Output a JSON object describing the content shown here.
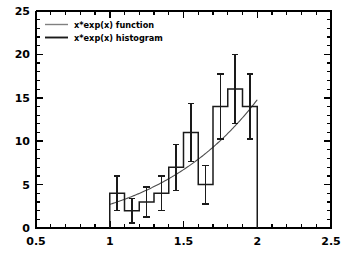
{
  "chart_data": {
    "type": "bar",
    "title": "",
    "xlabel": "",
    "ylabel": "",
    "xlim": [
      0.5,
      2.5
    ],
    "ylim": [
      0,
      25
    ],
    "grid": false,
    "legend_position": "top-left",
    "x_ticks": [
      "0.5",
      "1",
      "1.5",
      "2",
      "2.5"
    ],
    "x_tick_values": [
      0.5,
      1.0,
      1.5,
      2.0,
      2.5
    ],
    "x_minor_tick_values": [
      0.6,
      0.7,
      0.8,
      0.9,
      1.1,
      1.2,
      1.3,
      1.4,
      1.6,
      1.7,
      1.8,
      1.9,
      2.1,
      2.2,
      2.3,
      2.4
    ],
    "y_ticks": [
      "0",
      "5",
      "10",
      "15",
      "20",
      "25"
    ],
    "y_tick_values": [
      0,
      5,
      10,
      15,
      20,
      25
    ],
    "y_minor_tick_values": [
      1,
      2,
      3,
      4,
      6,
      7,
      8,
      9,
      11,
      12,
      13,
      14,
      16,
      17,
      18,
      19,
      21,
      22,
      23,
      24
    ],
    "bin_edges": [
      1.0,
      1.1,
      1.2,
      1.3,
      1.4,
      1.5,
      1.6,
      1.7,
      1.8,
      1.9,
      2.0
    ],
    "bin_centers": [
      1.05,
      1.15,
      1.25,
      1.35,
      1.45,
      1.55,
      1.65,
      1.75,
      1.85,
      1.95
    ],
    "values": [
      4,
      2,
      3,
      4,
      7,
      11,
      5,
      14,
      16,
      14
    ],
    "errors": [
      2.0,
      1.41,
      1.73,
      2.0,
      2.65,
      3.32,
      2.24,
      3.74,
      4.0,
      3.74
    ],
    "series": [
      {
        "name": "x*exp(x) histogram",
        "type": "step-histogram",
        "color": "#1a1a1a",
        "values": [
          4,
          2,
          3,
          4,
          7,
          11,
          5,
          14,
          16,
          14
        ]
      },
      {
        "name": "x*exp(x) function",
        "type": "line",
        "color": "#4d4d4d",
        "formula": "x*exp(x)",
        "x_range": [
          1.0,
          2.0
        ],
        "x": [
          1.0,
          1.1,
          1.2,
          1.3,
          1.4,
          1.5,
          1.6,
          1.7,
          1.8,
          1.9,
          2.0
        ],
        "y": [
          2.72,
          3.3,
          3.98,
          4.77,
          5.68,
          6.72,
          7.92,
          9.3,
          10.89,
          12.71,
          14.78
        ]
      }
    ]
  },
  "legend": {
    "entries": [
      {
        "label": "x*exp(x) function",
        "swatch": "line-light"
      },
      {
        "label": "x*exp(x) histogram",
        "swatch": "line-dark"
      }
    ]
  },
  "axes": {
    "x_labels": [
      "0.5",
      "1",
      "1.5",
      "2",
      "2.5"
    ],
    "y_labels": [
      "0",
      "5",
      "10",
      "15",
      "20",
      "25"
    ]
  },
  "colors": {
    "background": "#ffffff",
    "axis": "#000000",
    "histogram": "#1a1a1a",
    "function": "#4d4d4d"
  }
}
